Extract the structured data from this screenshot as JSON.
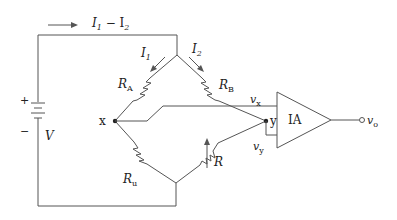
{
  "diagram": {
    "labels": {
      "source_current": "I",
      "source_current_sub1": "1",
      "source_current_minus": " − I",
      "source_current_sub2": "2",
      "i1": "I",
      "i1_sub": "1",
      "i2": "I",
      "i2_sub": "2",
      "ra": "R",
      "ra_sub": "A",
      "rb": "R",
      "rb_sub": "B",
      "ru": "R",
      "ru_sub": "u",
      "r": "R",
      "node_x": "x",
      "node_y": "y",
      "vx": "v",
      "vx_sub": "x",
      "vy": "v",
      "vy_sub": "y",
      "amp": "IA",
      "vo": "v",
      "vo_sub": "o",
      "battery_plus": "+",
      "battery_minus": "−",
      "battery_v": "V"
    },
    "components": [
      "battery V",
      "resistor RA",
      "resistor RB",
      "resistor Ru",
      "variable resistor R",
      "instrumentation amplifier IA"
    ]
  }
}
